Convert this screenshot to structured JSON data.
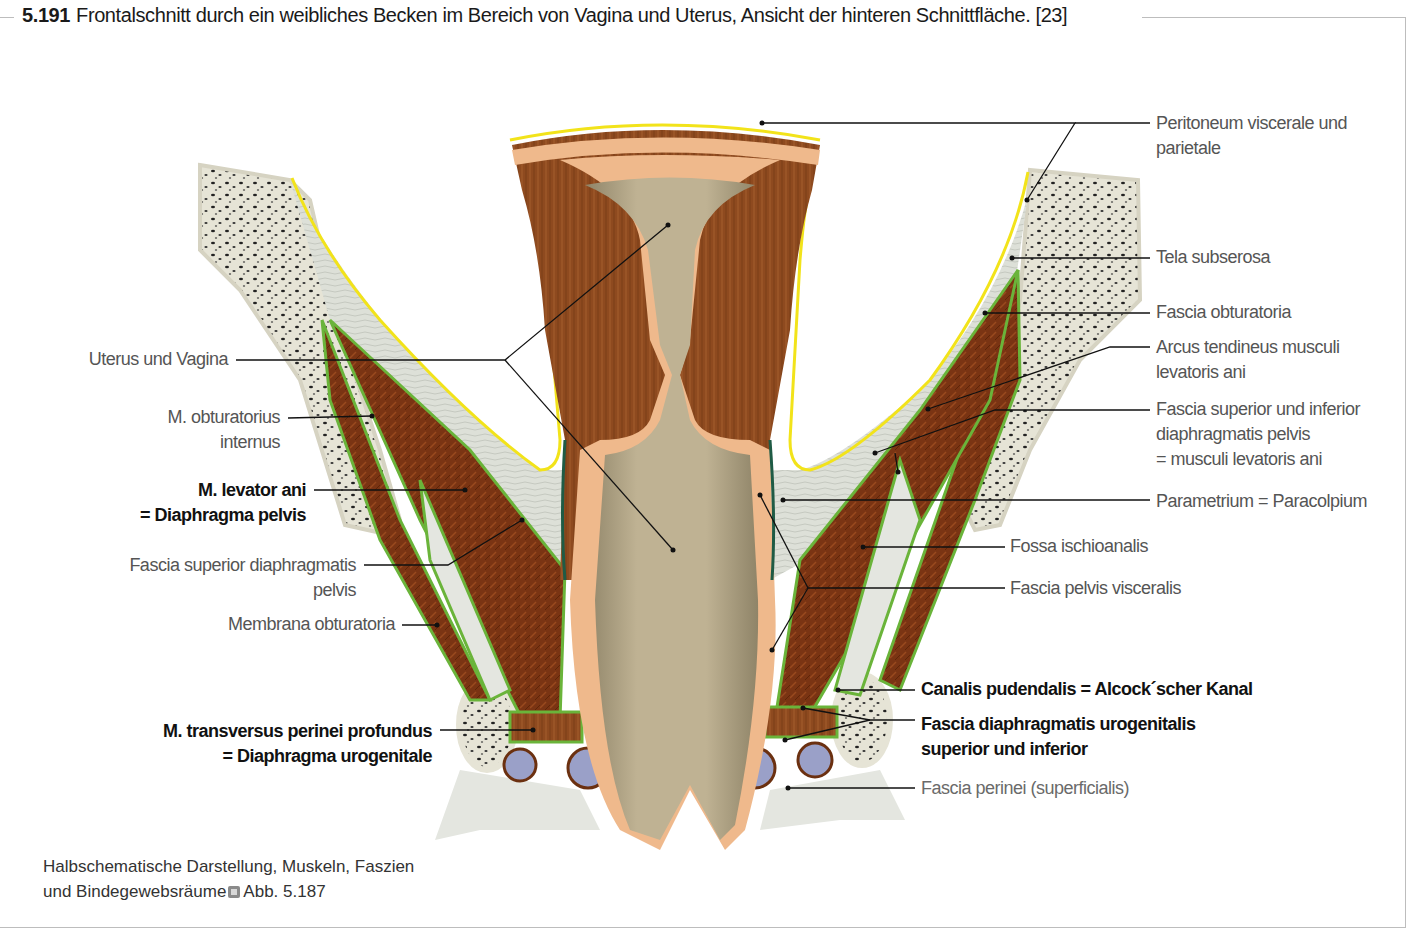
{
  "figure": {
    "number": "5.191",
    "caption": "Frontalschnitt durch ein weibliches Becken im Bereich von Vagina und Uterus, Ansicht der hinteren Schnittfläche. [23]"
  },
  "labels_left": [
    {
      "id": "uterus-vagina",
      "lines": [
        "Uterus und Vagina"
      ],
      "bold": false
    },
    {
      "id": "m-obturatorius-internus",
      "lines": [
        "M. obturatorius",
        "internus"
      ],
      "bold": false
    },
    {
      "id": "m-levator-ani",
      "lines": [
        "M. levator ani",
        "= Diaphragma pelvis"
      ],
      "bold": true
    },
    {
      "id": "fascia-superior-diaphragmatis-pelvis",
      "lines": [
        "Fascia superior diaphragmatis",
        "pelvis"
      ],
      "bold": false
    },
    {
      "id": "membrana-obturatoria",
      "lines": [
        "Membrana obturatoria"
      ],
      "bold": false
    },
    {
      "id": "m-transversus-perinei-profundus",
      "lines": [
        "M. transversus perinei profundus",
        "= Diaphragma urogenitale"
      ],
      "bold": true
    }
  ],
  "labels_right": [
    {
      "id": "peritoneum",
      "lines": [
        "Peritoneum viscerale und",
        "parietale"
      ],
      "bold": false
    },
    {
      "id": "tela-subserosa",
      "lines": [
        "Tela subserosa"
      ],
      "bold": false
    },
    {
      "id": "fascia-obturatoria",
      "lines": [
        "Fascia obturatoria"
      ],
      "bold": false
    },
    {
      "id": "arcus-tendineus",
      "lines": [
        "Arcus tendineus musculi",
        "levatoris ani"
      ],
      "bold": false
    },
    {
      "id": "fascia-superior-inferior",
      "lines": [
        "Fascia superior und inferior",
        "diaphragmatis pelvis",
        "= musculi levatoris ani"
      ],
      "bold": false
    },
    {
      "id": "parametrium",
      "lines": [
        "Parametrium = Paracolpium"
      ],
      "bold": false
    },
    {
      "id": "fossa-ischioanalis",
      "lines": [
        "Fossa ischioanalis"
      ],
      "bold": false
    },
    {
      "id": "fascia-pelvis-visceralis",
      "lines": [
        "Fascia pelvis visceralis"
      ],
      "bold": false
    },
    {
      "id": "canalis-pudendalis",
      "lines": [
        "Canalis pudendalis = Alcock´scher Kanal"
      ],
      "bold": true
    },
    {
      "id": "fascia-diaphragmatis-urogenitalis",
      "lines": [
        "Fascia diaphragmatis urogenitalis",
        "superior und inferior"
      ],
      "bold": true
    },
    {
      "id": "fascia-perinei",
      "lines": [
        "Fascia perinei (superficialis)"
      ],
      "bold": false
    }
  ],
  "note": {
    "text_line1": "Halbschematische Darstellung, Muskeln, Faszien",
    "text_line2": "und Bindegewebsräume",
    "reference_icon": "cross-reference-icon",
    "reference": "Abb. 5.187"
  },
  "colors": {
    "muscle": "#7a3413",
    "uterus_wall": "#8e4a1f",
    "mucosa": "#efb98c",
    "lumen": "#b3a585",
    "connective": "#dde0d8",
    "bone": "#e6e4d6",
    "peritoneum": "#f2e31a",
    "fascia": "#6ab43a",
    "visceral_fascia": "#1f5b45",
    "vessel": "#9aa0c8"
  }
}
